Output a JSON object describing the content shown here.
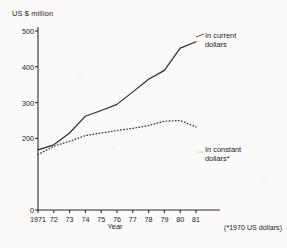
{
  "chart_data": {
    "type": "line",
    "title": "",
    "subtitle": "",
    "xlabel": "Year",
    "ylabel": "US $ million",
    "x": [
      1971,
      1972,
      1973,
      1974,
      1975,
      1976,
      1977,
      1978,
      1979,
      1980,
      1981
    ],
    "xtick_labels": [
      "1971",
      "72",
      "73",
      "74",
      "75",
      "76",
      "77",
      "78",
      "79",
      "80",
      "81"
    ],
    "ytick_labels": [
      "0",
      "200",
      "300",
      "400",
      "500"
    ],
    "ytick_values": [
      0,
      200,
      300,
      400,
      500
    ],
    "xlim": [
      1971,
      1981
    ],
    "ylim": [
      0,
      500
    ],
    "grid": false,
    "legend_position": "inline-right",
    "series": [
      {
        "name": "In current dollars",
        "style": "solid",
        "color": "#2b2b2b",
        "values": [
          168,
          182,
          215,
          262,
          278,
          295,
          330,
          365,
          390,
          452,
          470
        ]
      },
      {
        "name": "In constant dollars*",
        "style": "dotted",
        "color": "#3a3a3a",
        "values": [
          155,
          178,
          192,
          208,
          215,
          222,
          228,
          236,
          248,
          250,
          232
        ]
      }
    ],
    "annotations": [
      {
        "name": "series-label-current",
        "text_line1": "In current",
        "text_line2": "dollars"
      },
      {
        "name": "series-label-constant",
        "text_line1": "In constant",
        "text_line2": "dollars*"
      }
    ],
    "footnote": "(*1970 US dollars)"
  },
  "axes": {
    "y_label": "US $ million",
    "x_label": "Year"
  },
  "labels": {
    "current_line1": "In current",
    "current_line2": "dollars",
    "constant_line1": "In constant",
    "constant_line2": "dollars*"
  },
  "footnote": "(*1970 US dollars)",
  "colors": {
    "ink": "#2b2b2b",
    "paper": "#fbfaf8"
  }
}
